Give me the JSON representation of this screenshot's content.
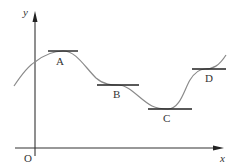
{
  "diagram": {
    "axes": {
      "y_label": "y",
      "x_label": "x",
      "origin_label": "O"
    },
    "points": [
      {
        "label": "A",
        "description": "local maximum with horizontal tangent"
      },
      {
        "label": "B",
        "description": "horizontal tangent (stationary inflection)"
      },
      {
        "label": "C",
        "description": "local minimum with horizontal tangent"
      },
      {
        "label": "D",
        "description": "horizontal tangent (stationary inflection)"
      }
    ],
    "colors": {
      "axis": "#333333",
      "curve": "#8a8a8a",
      "tangent": "#222222",
      "text": "#333333"
    }
  }
}
